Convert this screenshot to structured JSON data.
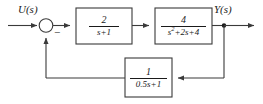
{
  "diagram": {
    "type": "control-system-block-diagram",
    "colors": {
      "line": "#3a3a3a",
      "text": "#1a1a1a",
      "block_fill": "#ffffff",
      "background": "#ffffff"
    },
    "signals": {
      "input_label": "U(s)",
      "output_label": "Y(s)"
    },
    "summing_junction": {
      "name": "summing-junction",
      "shape": "circle",
      "input_sign_feedback": "−"
    },
    "blocks": [
      {
        "id": "forward-block-1",
        "numerator": "2",
        "denominator": "s+1",
        "denominator_has_superscript": false
      },
      {
        "id": "forward-block-2",
        "numerator": "4",
        "denominator_prefix": "s",
        "denominator_superscript": "2",
        "denominator_suffix": "+2s+4",
        "denominator_has_superscript": true
      },
      {
        "id": "feedback-block",
        "numerator": "1",
        "denominator": "0.5s+1",
        "denominator_has_superscript": false
      }
    ]
  }
}
